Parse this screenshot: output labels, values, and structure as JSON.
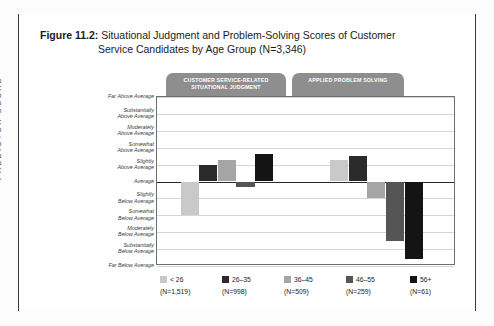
{
  "figure": {
    "number": "Figure 11.2:",
    "title_line1": "Situational Judgment and Problem-Solving Scores of Customer",
    "title_line2": "Service Candidates by Age Group (N=3,346)"
  },
  "tabs": [
    {
      "id": "situational-judgment",
      "label": "CUSTOMER SERVICE-RELATED SITUATIONAL JUDGMENT"
    },
    {
      "id": "applied-problem-solving",
      "label": "APPLIED PROBLEM SOLVING"
    }
  ],
  "axis": {
    "y_title": "PREDICTOR SCORE",
    "levels": [
      "Far Above Average",
      "Substantially Above Average",
      "Moderately Above Average",
      "Somewhat Above Average",
      "Slightly Above Average",
      "Average",
      "Slightly Below Average",
      "Somewhat Below Average",
      "Moderately Below Average",
      "Substantially Below Average",
      "Far Below Average"
    ]
  },
  "legend": [
    {
      "label": "< 26",
      "n": "(N=1,519)",
      "color": "#c9c9c9"
    },
    {
      "label": "26–35",
      "n": "(N=998)",
      "color": "#2b2b2b"
    },
    {
      "label": "36–45",
      "n": "(N=509)",
      "color": "#a5a5a5"
    },
    {
      "label": "46–55",
      "n": "(N=259)",
      "color": "#555555"
    },
    {
      "label": "56+",
      "n": "(N=61)",
      "color": "#141414"
    }
  ],
  "chart_data": {
    "type": "bar",
    "title": "Situational Judgment and Problem-Solving Scores of Customer Service Candidates by Age Group (N=3,346)",
    "xlabel": "",
    "ylabel": "PREDICTOR SCORE",
    "ylim": [
      -5,
      5
    ],
    "grid": true,
    "legend_position": "bottom",
    "ytick_labels": [
      "Far Above Average",
      "Substantially Above Average",
      "Moderately Above Average",
      "Somewhat Above Average",
      "Slightly Above Average",
      "Average",
      "Slightly Below Average",
      "Somewhat Below Average",
      "Moderately Below Average",
      "Substantially Below Average",
      "Far Below Average"
    ],
    "ytick_values": [
      5,
      4,
      3,
      2,
      1,
      0,
      -1,
      -2,
      -3,
      -4,
      -5
    ],
    "categories": [
      "CUSTOMER SERVICE-RELATED SITUATIONAL JUDGMENT",
      "APPLIED PROBLEM SOLVING"
    ],
    "series": [
      {
        "name": "< 26",
        "n": 1519,
        "color": "#c9c9c9",
        "values": [
          -2.0,
          1.3
        ]
      },
      {
        "name": "26–35",
        "n": 998,
        "color": "#2b2b2b",
        "values": [
          1.0,
          1.5
        ]
      },
      {
        "name": "36–45",
        "n": 509,
        "color": "#a5a5a5",
        "values": [
          1.3,
          -1.0
        ]
      },
      {
        "name": "46–55",
        "n": 259,
        "color": "#555555",
        "values": [
          -0.3,
          -3.5
        ]
      },
      {
        "name": "56+",
        "n": 61,
        "color": "#141414",
        "values": [
          1.6,
          -4.6
        ]
      }
    ]
  }
}
